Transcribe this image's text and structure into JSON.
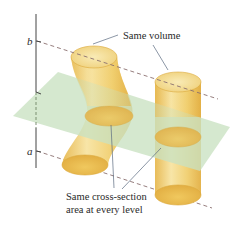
{
  "diagram": {
    "axis_labels": {
      "upper": "b",
      "lower": "a"
    },
    "annotations": {
      "top": "Same volume",
      "bottom_line1": "Same cross-section",
      "bottom_line2": "area at every level"
    },
    "solids": [
      {
        "name": "slanted-curved-cylinder",
        "description": "Curved (sheared) cylinder between a and b"
      },
      {
        "name": "right-circular-cylinder",
        "description": "Straight cylinder between a and b"
      }
    ],
    "plane": {
      "description": "Horizontal cross-section plane"
    },
    "colors": {
      "plane": "#c9e2c2",
      "cylinder_body": "#f1d173",
      "cylinder_top": "#f6e19a",
      "cylinder_edge": "#dcaa3c",
      "line": "#555555",
      "dash": "#8a6f6f"
    }
  }
}
